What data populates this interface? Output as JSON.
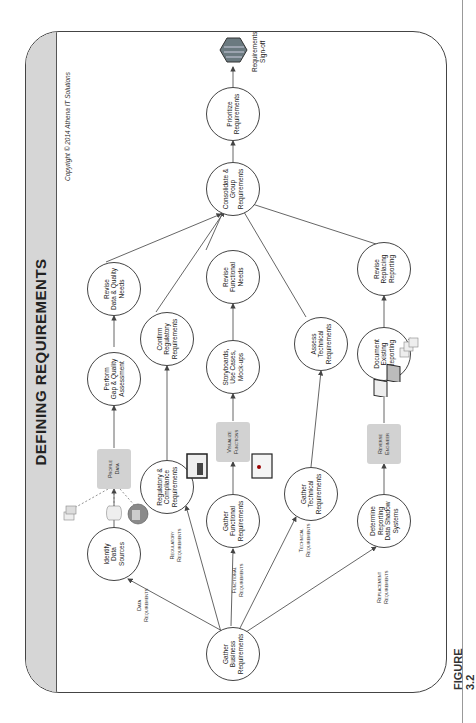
{
  "title": "DEFINING REQUIREMENTS",
  "copyright": "Copyright © 2014 Athena IT Solutions",
  "figure_label": "FIGURE 3.2",
  "nodes": {
    "gather_business": "Gather\nBusiness\nRequirements",
    "identify_data": "Identify\nData\nSources",
    "regulatory_compliance": "Regulatory &\nCompliance\nRequirements",
    "gather_functional": "Gather\nFunctional\nRequirements",
    "gather_technical": "Gather\nTechnical\nRequirements",
    "determine_reporting": "Determine\nReporting\nData Shadow\nSystems",
    "perform_gap": "Perform\nGap & Quality\nAssessment",
    "confirm_regulatory": "Confirm\nRegulatory\nRequirements",
    "storyboards": "Storyboards,\nUse Cases,\nMock-ups",
    "assess_technical": "Assess\nTechnical\nRequirements",
    "document_existing": "Document\nExisting\nReporting",
    "revise_data": "Revise\nData & Quality\nNeeds",
    "revise_functional": "Revise\nFunctional\nNeeds",
    "revise_replacing": "Revise\nReplacing\nReporting",
    "consolidate": "Consolidate &\nGroup\nRequirements",
    "prioritize": "Prioritize\nRequirements"
  },
  "boxes": {
    "profile_data": "Profile\nData",
    "visualize_functions": "Visualize\nFunctions",
    "reverse_engineer": "Reverse\nEngineer"
  },
  "edge_labels": {
    "data": "Data\nRequirements",
    "regulatory": "Regulatory\nRequirements",
    "functional": "Functional\nRequirements",
    "technical": "Technical\nRequirements",
    "replacement": "Replacement\nRequirements"
  },
  "end_label": "Requirements\nSign-off",
  "colors": {
    "band": "#d6d6d6",
    "box": "#d2d2d2",
    "line": "#555555"
  }
}
